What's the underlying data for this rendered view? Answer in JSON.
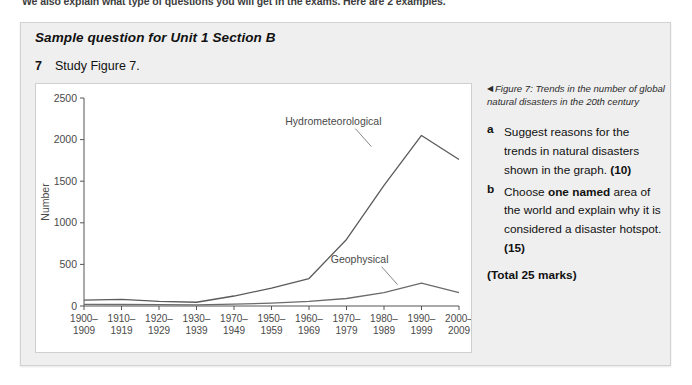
{
  "intro_line": "We also explain what type of questions you will get in the exams. Here are 2 examples.",
  "panel": {
    "title": "Sample question for Unit 1 Section B",
    "question_number": "7",
    "question_text": "Study Figure 7."
  },
  "figure_caption": {
    "marker": "◀",
    "text": "Figure 7: Trends in the number of global natural disasters in the 20th century"
  },
  "sub_questions": [
    {
      "letter": "a",
      "parts": [
        {
          "text": "Suggest reasons for the trends in natural disasters shown in the graph. ",
          "bold": false
        },
        {
          "text": "(10)",
          "bold": true
        }
      ]
    },
    {
      "letter": "b",
      "parts": [
        {
          "text": "Choose ",
          "bold": false
        },
        {
          "text": "one named",
          "bold": true
        },
        {
          "text": " area of the world and explain why it is considered a disaster hotspot. ",
          "bold": false
        },
        {
          "text": "(15)",
          "bold": true
        }
      ]
    }
  ],
  "total_marks": "(Total 25 marks)",
  "chart_data": {
    "type": "line",
    "title": "",
    "xlabel": "",
    "ylabel": "Number",
    "ylim": [
      0,
      2500
    ],
    "yticks": [
      0,
      500,
      1000,
      1500,
      2000,
      2500
    ],
    "ytick_labels": [
      "0",
      "500",
      "1000",
      "1500",
      "2000",
      "2500"
    ],
    "grid": false,
    "legend": "inline-labels",
    "categories": [
      "1900–\n1909",
      "1910–\n1919",
      "1920–\n1929",
      "1930–\n1939",
      "1970–\n1949",
      "1950–\n1959",
      "1960–\n1969",
      "1970–\n1979",
      "1980–\n1989",
      "1990–\n1999",
      "2000–\n2009"
    ],
    "series": [
      {
        "name": "Hydrometeorological",
        "color": "#5a5a5a",
        "values": [
          70,
          80,
          55,
          45,
          120,
          215,
          330,
          800,
          1450,
          2050,
          1760
        ],
        "label_x_frac": 0.665,
        "label_y_value": 2180
      },
      {
        "name": "Geophysical",
        "color": "#6b6b6b",
        "values": [
          20,
          18,
          16,
          14,
          22,
          35,
          55,
          90,
          160,
          275,
          160
        ],
        "label_x_frac": 0.735,
        "label_y_value": 520
      }
    ]
  }
}
